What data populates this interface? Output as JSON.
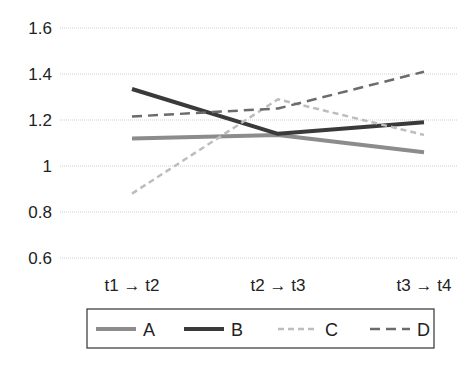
{
  "chart_data": {
    "type": "line",
    "title": "",
    "xlabel": "",
    "ylabel": "",
    "categories": [
      "t1 → t2",
      "t2 → t3",
      "t3 → t4"
    ],
    "ylim": [
      0.6,
      1.6
    ],
    "yticks": [
      0.6,
      0.8,
      1,
      1.2,
      1.4,
      1.6
    ],
    "ytick_labels": [
      "0.6",
      "0.8",
      "1",
      "1.2",
      "1.4",
      "1.6"
    ],
    "grid": true,
    "legend_position": "bottom",
    "series": [
      {
        "name": "A",
        "values": [
          1.12,
          1.135,
          1.06
        ],
        "color": "#8c8c8c",
        "width": 4,
        "dash": ""
      },
      {
        "name": "B",
        "values": [
          1.335,
          1.14,
          1.19
        ],
        "color": "#3a3a3a",
        "width": 4,
        "dash": ""
      },
      {
        "name": "C",
        "values": [
          0.88,
          1.29,
          1.135
        ],
        "color": "#bdbdbd",
        "width": 2.5,
        "dash": "6,4"
      },
      {
        "name": "D",
        "values": [
          1.215,
          1.25,
          1.41
        ],
        "color": "#6b6b6b",
        "width": 2.5,
        "dash": "10,6"
      }
    ]
  }
}
